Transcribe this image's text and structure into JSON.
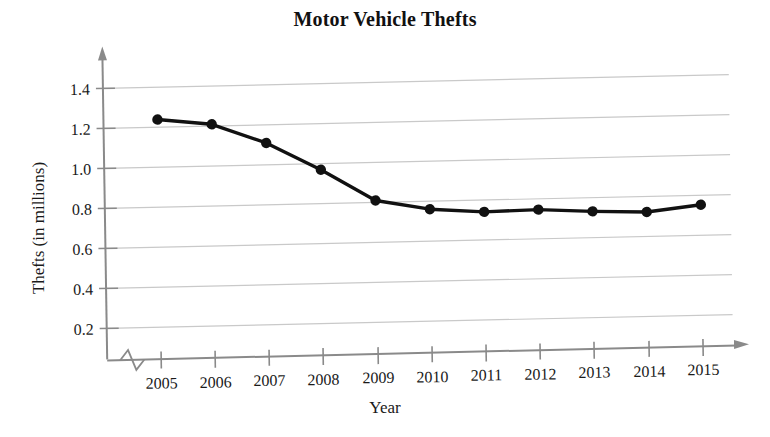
{
  "chart_data": {
    "type": "line",
    "title": "Motor Vehicle Thefts",
    "xlabel": "Year",
    "ylabel": "Thefts (in millions)",
    "categories": [
      "2005",
      "2006",
      "2007",
      "2008",
      "2009",
      "2010",
      "2011",
      "2012",
      "2013",
      "2014",
      "2015"
    ],
    "x": [
      2005,
      2006,
      2007,
      2008,
      2009,
      2010,
      2011,
      2012,
      2013,
      2014,
      2015
    ],
    "values": [
      1.24,
      1.21,
      1.11,
      0.97,
      0.81,
      0.76,
      0.74,
      0.745,
      0.73,
      0.72,
      0.75
    ],
    "series": [
      {
        "name": "Motor vehicle thefts",
        "values": [
          1.24,
          1.21,
          1.11,
          0.97,
          0.81,
          0.76,
          0.74,
          0.745,
          0.73,
          0.72,
          0.75
        ]
      }
    ],
    "ylim": [
      0,
      1.5
    ],
    "yticks": [
      0.2,
      0.4,
      0.6,
      0.8,
      1.0,
      1.2,
      1.4
    ],
    "ytick_labels": [
      "0.2",
      "0.4",
      "0.6",
      "0.8",
      "1.0",
      "1.2",
      "1.4"
    ],
    "xtick_labels": [
      "2005",
      "2006",
      "2007",
      "2008",
      "2009",
      "2010",
      "2011",
      "2012",
      "2013",
      "2014",
      "2015"
    ],
    "grid": "horizontal",
    "legend": "none",
    "axis_break": "x-axis zigzag between origin and first category",
    "marker": "filled circle",
    "colors": {
      "line": "#111111",
      "marker": "#111111",
      "gridline": "#c8c8c8",
      "axis": "#8a8a8a",
      "background": "#ffffff",
      "text": "#1a1a1a"
    }
  }
}
